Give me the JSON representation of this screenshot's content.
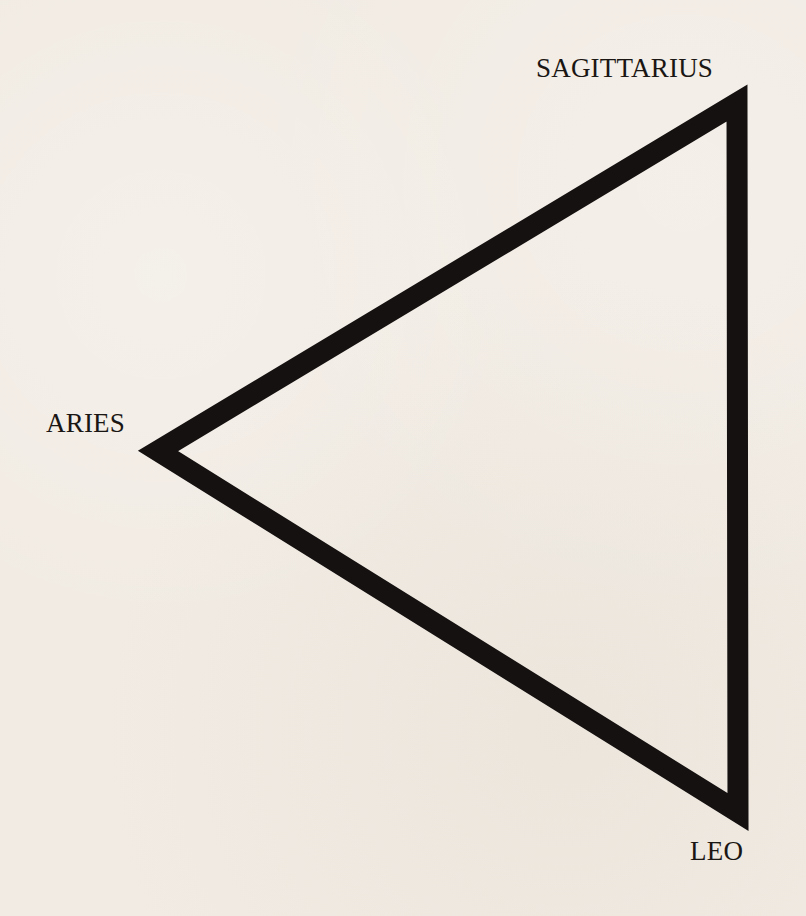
{
  "diagram": {
    "type": "triangle",
    "stroke_color": "#141110",
    "background_color": "#f1ebe3",
    "vertices": [
      {
        "name": "SAGITTARIUS",
        "x": 737,
        "y": 103
      },
      {
        "name": "ARIES",
        "x": 158,
        "y": 451
      },
      {
        "name": "LEO",
        "x": 738,
        "y": 812
      }
    ]
  },
  "labels": {
    "top_right": "SAGITTARIUS",
    "left": "ARIES",
    "bottom_right": "LEO"
  }
}
